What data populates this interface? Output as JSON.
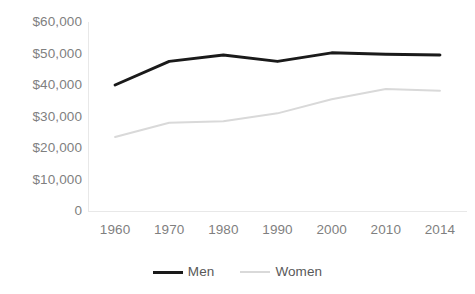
{
  "chart_data": {
    "type": "line",
    "title": "",
    "subtitle": "",
    "xlabel": "",
    "ylabel": "",
    "categories": [
      "1960",
      "1970",
      "1980",
      "1990",
      "2000",
      "2010",
      "2014"
    ],
    "series": [
      {
        "name": "Men",
        "color": "#1a1a1a",
        "line_width": 3,
        "values": [
          40000,
          47500,
          49500,
          47500,
          50200,
          49800,
          49500
        ]
      },
      {
        "name": "Women",
        "color": "#d9d9d9",
        "line_width": 2,
        "values": [
          23500,
          28000,
          28500,
          31000,
          35500,
          38700,
          38200
        ]
      }
    ],
    "ylim": [
      0,
      60000
    ],
    "ytick_values": [
      60000,
      50000,
      40000,
      30000,
      20000,
      10000,
      0
    ],
    "ytick_labels": [
      "$60,000",
      "$50,000",
      "$40,000",
      "$30,000",
      "$20,000",
      "$10,000",
      "0"
    ],
    "grid": false,
    "legend_position": "bottom",
    "axis_color": "#e8e8e8",
    "tick_label_color": "#7f7f7f"
  },
  "legend": {
    "entries": [
      {
        "label": "Men"
      },
      {
        "label": "Women"
      }
    ]
  }
}
